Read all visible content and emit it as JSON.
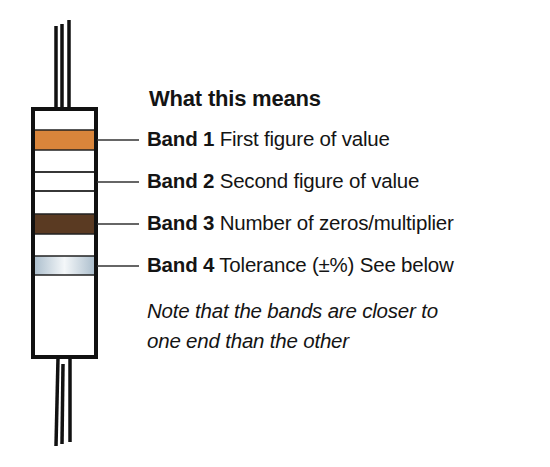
{
  "title": "What this means",
  "colors": {
    "outline": "#111111",
    "band1": "#d9853b",
    "band2": "#ffffff",
    "band3": "#5a3a22",
    "band4": "#c9d6df",
    "leader": "#333333"
  },
  "bands": [
    {
      "label": "Band 1",
      "description": "First figure of value",
      "color": "orange"
    },
    {
      "label": "Band 2",
      "description": "Second figure of value",
      "color": "white"
    },
    {
      "label": "Band 3",
      "description": "Number of zeros/multiplier",
      "color": "brown"
    },
    {
      "label": "Band 4",
      "description": "Tolerance (±%) See below",
      "color": "silver"
    }
  ],
  "note": {
    "line1": "Note that the bands are closer to",
    "line2": "one end than the other"
  }
}
